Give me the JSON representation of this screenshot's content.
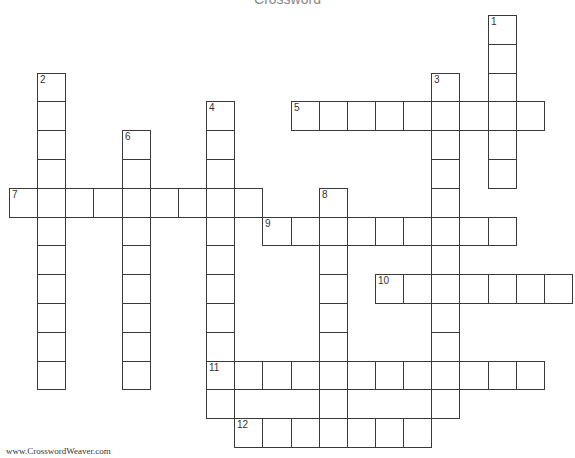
{
  "title": "Crossword",
  "footer": "www.CrosswordWeaver.com",
  "grid": {
    "origin_x": 9,
    "origin_y": 15,
    "cell_w": 28.15,
    "cell_h": 28.8,
    "border_color": "#3a3a3a"
  },
  "entries": [
    {
      "number": 1,
      "direction": "down",
      "col": 17,
      "row": 0,
      "length": 6
    },
    {
      "number": 2,
      "direction": "down",
      "col": 1,
      "row": 2,
      "length": 11
    },
    {
      "number": 3,
      "direction": "down",
      "col": 15,
      "row": 2,
      "length": 12
    },
    {
      "number": 4,
      "direction": "down",
      "col": 7,
      "row": 3,
      "length": 11
    },
    {
      "number": 5,
      "direction": "across",
      "col": 10,
      "row": 3,
      "length": 9
    },
    {
      "number": 6,
      "direction": "down",
      "col": 4,
      "row": 4,
      "length": 9
    },
    {
      "number": 7,
      "direction": "across",
      "col": 0,
      "row": 6,
      "length": 9
    },
    {
      "number": 8,
      "direction": "down",
      "col": 11,
      "row": 6,
      "length": 9
    },
    {
      "number": 9,
      "direction": "across",
      "col": 9,
      "row": 7,
      "length": 9
    },
    {
      "number": 10,
      "direction": "across",
      "col": 13,
      "row": 9,
      "length": 7
    },
    {
      "number": 11,
      "direction": "across",
      "col": 7,
      "row": 12,
      "length": 12
    },
    {
      "number": 12,
      "direction": "across",
      "col": 8,
      "row": 14,
      "length": 7
    }
  ]
}
